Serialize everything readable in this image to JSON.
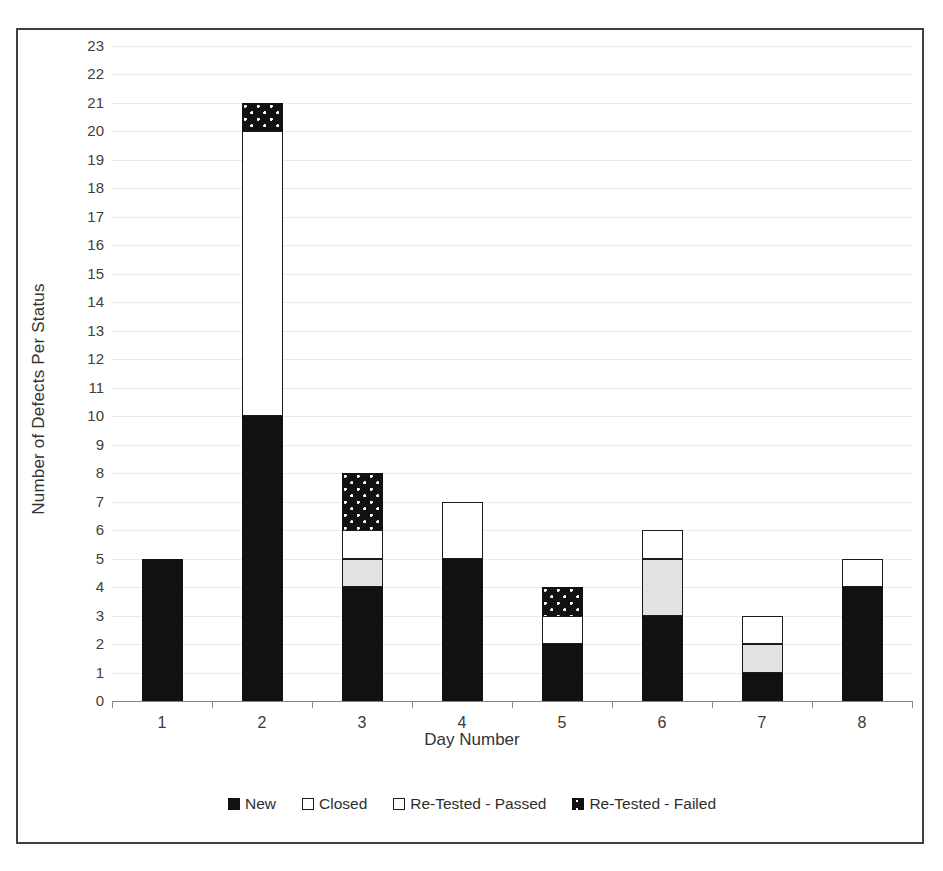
{
  "chart_data": {
    "type": "bar",
    "subtype": "stacked",
    "title": "",
    "xlabel": "Day Number",
    "ylabel": "Number of Defects Per Status",
    "categories": [
      "1",
      "2",
      "3",
      "4",
      "5",
      "6",
      "7",
      "8"
    ],
    "ylim": [
      0,
      23
    ],
    "ytick_step": 1,
    "yticks": [
      "23",
      "22",
      "21",
      "20",
      "19",
      "18",
      "17",
      "16",
      "15",
      "14",
      "13",
      "12",
      "11",
      "10",
      "9",
      "8",
      "7",
      "6",
      "5",
      "4",
      "3",
      "2",
      "1",
      "0"
    ],
    "grid": true,
    "grid_axis": "y",
    "legend_position": "bottom",
    "stack_order_bottom_to_top": [
      "New",
      "Re-Tested - Passed",
      "Closed",
      "Re-Tested - Failed"
    ],
    "series": [
      {
        "name": "New",
        "swatch": "sw-new",
        "segment_class": "seg-new",
        "color": "#111111",
        "values": [
          5,
          10,
          4,
          5,
          2,
          3,
          1,
          4
        ]
      },
      {
        "name": "Closed",
        "swatch": "sw-closed",
        "segment_class": "seg-closed",
        "color": "#ffffff",
        "values": [
          0,
          10,
          1,
          2,
          1,
          1,
          1,
          1
        ]
      },
      {
        "name": "Re-Tested - Passed",
        "swatch": "sw-passed",
        "segment_class": "seg-passed",
        "color": "#e2e2e2",
        "values": [
          0,
          0,
          1,
          0,
          0,
          2,
          1,
          0
        ]
      },
      {
        "name": "Re-Tested - Failed",
        "swatch": "sw-failed",
        "segment_class": "seg-failed",
        "color": "#111111",
        "values": [
          0,
          1,
          2,
          0,
          1,
          0,
          0,
          0
        ]
      }
    ],
    "totals": [
      5,
      21,
      8,
      7,
      4,
      6,
      3,
      5
    ],
    "bars": [
      {
        "category": "1",
        "segments": [
          {
            "series": "New",
            "from": 0,
            "to": 5
          }
        ]
      },
      {
        "category": "2",
        "segments": [
          {
            "series": "New",
            "from": 0,
            "to": 10
          },
          {
            "series": "Closed",
            "from": 10,
            "to": 20
          },
          {
            "series": "Re-Tested - Failed",
            "from": 20,
            "to": 21
          }
        ]
      },
      {
        "category": "3",
        "segments": [
          {
            "series": "New",
            "from": 0,
            "to": 4
          },
          {
            "series": "Re-Tested - Passed",
            "from": 4,
            "to": 5
          },
          {
            "series": "Closed",
            "from": 5,
            "to": 6
          },
          {
            "series": "Re-Tested - Failed",
            "from": 6,
            "to": 8
          }
        ]
      },
      {
        "category": "4",
        "segments": [
          {
            "series": "New",
            "from": 0,
            "to": 5
          },
          {
            "series": "Closed",
            "from": 5,
            "to": 7
          }
        ]
      },
      {
        "category": "5",
        "segments": [
          {
            "series": "New",
            "from": 0,
            "to": 2
          },
          {
            "series": "Closed",
            "from": 2,
            "to": 3
          },
          {
            "series": "Re-Tested - Failed",
            "from": 3,
            "to": 4
          }
        ]
      },
      {
        "category": "6",
        "segments": [
          {
            "series": "New",
            "from": 0,
            "to": 3
          },
          {
            "series": "Re-Tested - Passed",
            "from": 3,
            "to": 5
          },
          {
            "series": "Closed",
            "from": 5,
            "to": 6
          }
        ]
      },
      {
        "category": "7",
        "segments": [
          {
            "series": "New",
            "from": 0,
            "to": 1
          },
          {
            "series": "Re-Tested - Passed",
            "from": 1,
            "to": 2
          },
          {
            "series": "Closed",
            "from": 2,
            "to": 3
          }
        ]
      },
      {
        "category": "8",
        "segments": [
          {
            "series": "New",
            "from": 0,
            "to": 4
          },
          {
            "series": "Closed",
            "from": 4,
            "to": 5
          }
        ]
      }
    ]
  },
  "legend": {
    "items": [
      {
        "label": "New",
        "swatch": "sw-new"
      },
      {
        "label": "Closed",
        "swatch": "sw-closed"
      },
      {
        "label": "Re-Tested - Passed",
        "swatch": "sw-passed"
      },
      {
        "label": "Re-Tested - Failed",
        "swatch": "sw-failed"
      }
    ]
  }
}
